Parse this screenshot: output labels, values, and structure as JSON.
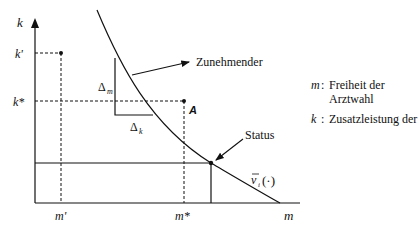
{
  "diagram": {
    "axes": {
      "y_label": "k",
      "x_label": "m",
      "y_ticks": [
        "k'",
        "k*"
      ],
      "x_ticks": [
        "m'",
        "m*"
      ]
    },
    "points": {
      "A_label": "A"
    },
    "triangle": {
      "delta_m": "Δ",
      "delta_m_sub": "m",
      "delta_k": "Δ",
      "delta_k_sub": "k"
    },
    "annotations": {
      "increasing": "Zunehmender",
      "status": "Status",
      "curve_label_v": "v",
      "curve_label_sub": "i",
      "curve_label_args": "(·)"
    },
    "legend": [
      {
        "key": "m",
        "text": "Freiheit der Arztwahl"
      },
      {
        "key": "k",
        "text": "Zusatzleistung der"
      }
    ]
  }
}
